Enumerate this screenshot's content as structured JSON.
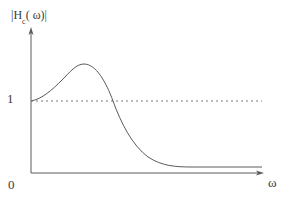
{
  "diagram": {
    "y_axis": {
      "label_prefix": "|H",
      "label_subscript": "c",
      "label_suffix": "( ω)|",
      "ticks": [
        {
          "label": "1",
          "value": 1
        },
        {
          "label": "0",
          "value": 0
        }
      ]
    },
    "x_axis": {
      "label": "ω"
    },
    "reference_line": {
      "style": "dashed",
      "value": 1,
      "color": "#7a7a7a"
    },
    "curve": {
      "description": "Starts at 1, rises to a peak above 1, then falls below 1 and decays to a near-zero flat plateau",
      "color": "#5a5a5a",
      "key_points": [
        {
          "name": "start",
          "x": 31,
          "y": 101
        },
        {
          "name": "peak",
          "x": 83,
          "y": 64
        },
        {
          "name": "crossing",
          "x": 113,
          "y": 101
        },
        {
          "name": "plateau-start",
          "x": 190,
          "y": 167
        },
        {
          "name": "end",
          "x": 262,
          "y": 167
        }
      ]
    },
    "colors": {
      "axis": "#5a5a5a",
      "text": "#3a3a3a",
      "background": "#ffffff"
    }
  }
}
